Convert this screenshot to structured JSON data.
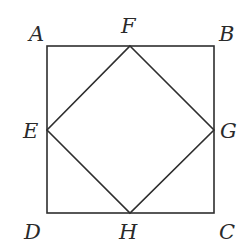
{
  "diagram": {
    "type": "geometry",
    "outer_square": {
      "vertices": [
        "A",
        "B",
        "C",
        "D"
      ]
    },
    "inner_square": {
      "vertices": [
        "F",
        "G",
        "H",
        "E"
      ]
    },
    "points": {
      "A": {
        "label": "A",
        "x": 47,
        "y": 46,
        "label_x": 29,
        "label_y": 41
      },
      "B": {
        "label": "B",
        "x": 214,
        "y": 46,
        "label_x": 219,
        "label_y": 41
      },
      "C": {
        "label": "C",
        "x": 214,
        "y": 213,
        "label_x": 219,
        "label_y": 239
      },
      "D": {
        "label": "D",
        "x": 47,
        "y": 213,
        "label_x": 24,
        "label_y": 239
      },
      "E": {
        "label": "E",
        "x": 47,
        "y": 130,
        "label_x": 23,
        "label_y": 138
      },
      "F": {
        "label": "F",
        "x": 130,
        "y": 46,
        "label_x": 121,
        "label_y": 33
      },
      "G": {
        "label": "G",
        "x": 214,
        "y": 130,
        "label_x": 220,
        "label_y": 138
      },
      "H": {
        "label": "H",
        "x": 130,
        "y": 213,
        "label_x": 119,
        "label_y": 239
      }
    },
    "colors": {
      "line": "#2e2e2e",
      "text": "#2a2a2a",
      "background": "#ffffff"
    }
  }
}
